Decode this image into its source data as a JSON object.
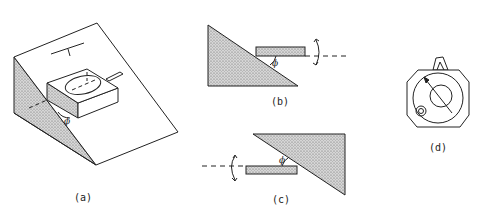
{
  "figure": {
    "panels": [
      {
        "id": "a",
        "label": "(a)",
        "description": "Compass-like instrument resting on inclined wedge, angle phi"
      },
      {
        "id": "b",
        "label": "(b)",
        "description": "Side view: bar above wedge slope, angle phi, rotation arrow with dashed axis to right"
      },
      {
        "id": "c",
        "label": "(c)",
        "description": "Inverted view: bar below inverted wedge, angle phi, rotation arrow with dashed axis to left"
      },
      {
        "id": "d",
        "label": "(d)",
        "description": "Octagonal clinometer face with needle arrow and bubble level"
      }
    ],
    "angle_symbol": "ϕ",
    "colors": {
      "line": "#222222",
      "shade": "#bdbdbd",
      "background": "#ffffff"
    }
  }
}
